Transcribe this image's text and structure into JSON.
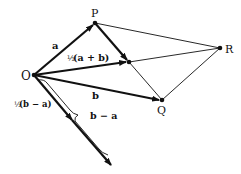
{
  "diagram": {
    "type": "vector-parallelogram",
    "points": {
      "O": {
        "label": "O",
        "x": 34,
        "y": 75
      },
      "P": {
        "label": "P",
        "x": 95,
        "y": 23
      },
      "R": {
        "label": "R",
        "x": 220,
        "y": 48
      },
      "Q": {
        "label": "Q",
        "x": 162,
        "y": 100
      },
      "M": {
        "label": "",
        "x": 129,
        "y": 62
      }
    },
    "labels": {
      "a": "a",
      "b": "b",
      "half_a_plus_b_frac": "½",
      "half_a_plus_b": "(a + b)",
      "b_minus_a": "b − a",
      "half_b_minus_a_frac": "½",
      "half_b_minus_a": "(b − a)"
    },
    "colors": {
      "ink": "#111111",
      "background": "#ffffff"
    }
  }
}
